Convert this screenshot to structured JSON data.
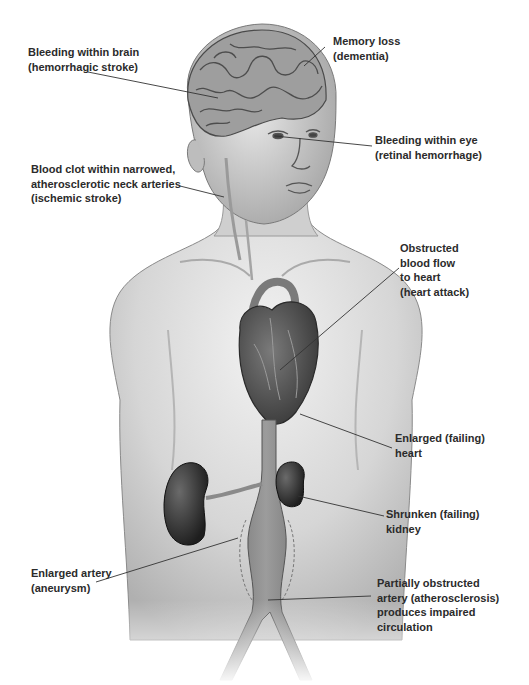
{
  "diagram": {
    "labels": [
      {
        "id": "brain-bleed",
        "line1": "Bleeding within brain",
        "line2": "(hemorrhagic stroke)"
      },
      {
        "id": "memory-loss",
        "line1": "Memory loss",
        "line2": "(dementia)"
      },
      {
        "id": "eye-bleed",
        "line1": "Bleeding within eye",
        "line2": "(retinal hemorrhage)"
      },
      {
        "id": "neck-clot",
        "line1": "Blood clot within narrowed,",
        "line2": "atherosclerotic neck arteries",
        "line3": "(ischemic stroke)"
      },
      {
        "id": "heart-attack",
        "line1": "Obstructed",
        "line2": "blood flow",
        "line3": "to heart",
        "line4": "(heart attack)"
      },
      {
        "id": "enlarged-heart",
        "line1": "Enlarged (failing)",
        "line2": "heart"
      },
      {
        "id": "shrunken-kidney",
        "line1": "Shrunken (failing)",
        "line2": "kidney"
      },
      {
        "id": "aneurysm",
        "line1": "Enlarged artery",
        "line2": "(aneurysm)"
      },
      {
        "id": "atherosclerosis",
        "line1": "Partially obstructed",
        "line2": "artery (atherosclerosis)",
        "line3": "produces impaired",
        "line4": "circulation"
      }
    ],
    "colors": {
      "skin_light": "#e8e8e8",
      "skin_mid": "#c9c9c9",
      "skin_dark": "#9a9a9a",
      "organ": "#4a4a4a",
      "organ_dark": "#2a2a2a",
      "artery": "#8a8a8a",
      "leader_line": "#333333",
      "text": "#2b2b2b"
    }
  }
}
